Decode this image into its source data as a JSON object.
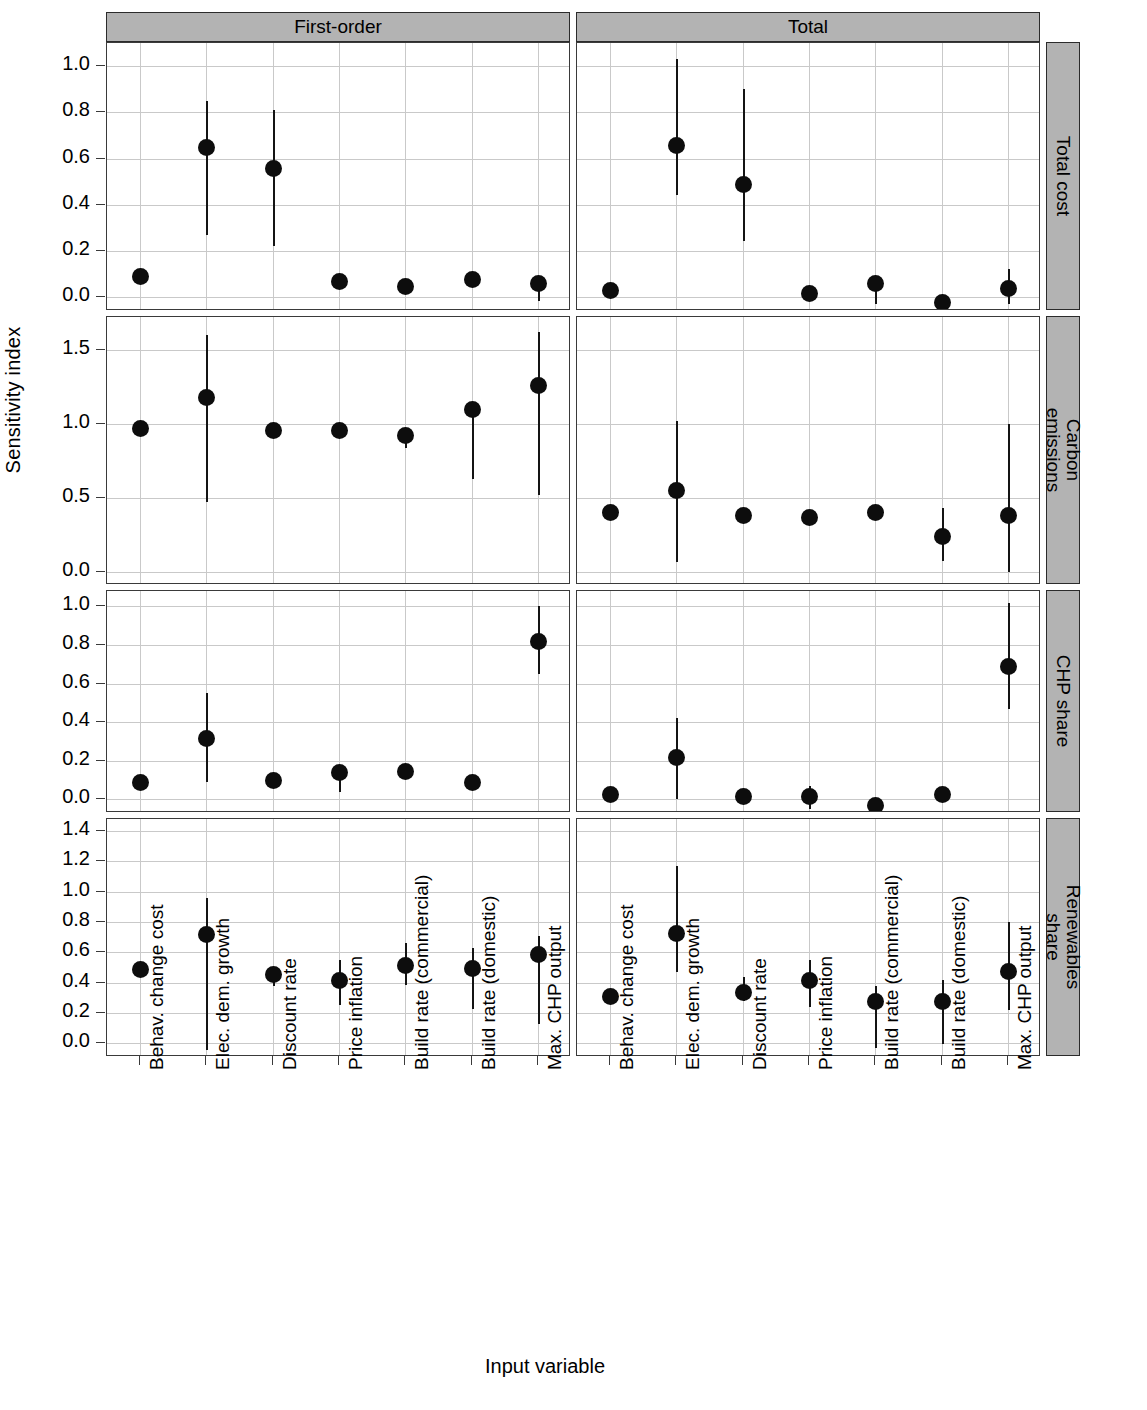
{
  "figure": {
    "y_axis_title": "Sensitivity index",
    "x_axis_title": "Input variable",
    "column_strips": [
      "First-order",
      "Total"
    ],
    "row_strips": [
      "Total cost",
      "Carbon\nemissions",
      "CHP share",
      "Renewables\nshare"
    ],
    "strip_fill": "#b3b3b3",
    "point_color": "#0d0d0d",
    "grid_color": "#c9c9c9"
  },
  "chart_data": {
    "type": "scatter",
    "title": "",
    "xlabel": "Input variable",
    "ylabel": "Sensitivity index",
    "grid": true,
    "legend": "none",
    "categories": [
      "Behav. change cost",
      "Elec. dem. growth",
      "Discount rate",
      "Price inflation",
      "Build rate (commercial)",
      "Build rate (domestic)",
      "Max. CHP output"
    ],
    "columns": [
      "First-order",
      "Total"
    ],
    "rows": [
      "Total cost",
      "Carbon emissions",
      "CHP share",
      "Renewables share"
    ],
    "panels": [
      {
        "row": "Total cost",
        "column": "First-order",
        "ylim": [
          -0.06,
          1.1
        ],
        "yticks": [
          0.0,
          0.2,
          0.4,
          0.6,
          0.8,
          1.0
        ],
        "yticklabels": [
          "0.0",
          "0.2",
          "0.4",
          "0.6",
          "0.8",
          "1.0"
        ],
        "values": [
          0.09,
          0.65,
          0.56,
          0.07,
          0.05,
          0.08,
          0.06
        ],
        "lower": [
          0.09,
          0.27,
          0.22,
          0.07,
          0.05,
          0.08,
          -0.02
        ],
        "upper": [
          0.09,
          0.85,
          0.81,
          0.07,
          0.05,
          0.08,
          0.06
        ]
      },
      {
        "row": "Total cost",
        "column": "Total",
        "ylim": [
          -0.06,
          1.1
        ],
        "yticks": [
          0.0,
          0.2,
          0.4,
          0.6,
          0.8,
          1.0
        ],
        "yticklabels": [
          "0.0",
          "0.2",
          "0.4",
          "0.6",
          "0.8",
          "1.0"
        ],
        "values": [
          0.03,
          0.66,
          0.49,
          0.02,
          0.06,
          -0.02,
          0.04
        ],
        "lower": [
          0.03,
          0.44,
          0.24,
          0.02,
          -0.03,
          -0.02,
          -0.03
        ],
        "upper": [
          0.03,
          1.03,
          0.9,
          0.02,
          0.09,
          -0.02,
          0.12
        ]
      },
      {
        "row": "Carbon emissions",
        "column": "First-order",
        "ylim": [
          -0.09,
          1.72
        ],
        "yticks": [
          0.0,
          0.5,
          1.0,
          1.5
        ],
        "yticklabels": [
          "0.0",
          "0.5",
          "1.0",
          "1.5"
        ],
        "values": [
          0.97,
          1.18,
          0.96,
          0.96,
          0.92,
          1.1,
          1.26
        ],
        "lower": [
          0.97,
          0.47,
          0.93,
          0.94,
          0.83,
          0.63,
          0.52
        ],
        "upper": [
          0.97,
          1.6,
          0.96,
          0.96,
          0.92,
          1.1,
          1.62
        ]
      },
      {
        "row": "Carbon emissions",
        "column": "Total",
        "ylim": [
          -0.09,
          1.72
        ],
        "yticks": [
          0.0,
          0.5,
          1.0,
          1.5
        ],
        "yticklabels": [
          "0.0",
          "0.5",
          "1.0",
          "1.5"
        ],
        "values": [
          0.4,
          0.55,
          0.38,
          0.37,
          0.4,
          0.24,
          0.38
        ],
        "lower": [
          0.4,
          0.07,
          0.38,
          0.37,
          0.38,
          0.07,
          0.0
        ],
        "upper": [
          0.4,
          1.02,
          0.38,
          0.37,
          0.45,
          0.43,
          1.0
        ]
      },
      {
        "row": "CHP share",
        "column": "First-order",
        "ylim": [
          -0.07,
          1.08
        ],
        "yticks": [
          0.0,
          0.2,
          0.4,
          0.6,
          0.8,
          1.0
        ],
        "yticklabels": [
          "0.0",
          "0.2",
          "0.4",
          "0.6",
          "0.8",
          "1.0"
        ],
        "values": [
          0.09,
          0.32,
          0.1,
          0.14,
          0.15,
          0.09,
          0.82
        ],
        "lower": [
          0.09,
          0.09,
          0.06,
          0.04,
          0.11,
          0.05,
          0.65
        ],
        "upper": [
          0.09,
          0.55,
          0.1,
          0.17,
          0.18,
          0.09,
          1.0
        ]
      },
      {
        "row": "CHP share",
        "column": "Total",
        "ylim": [
          -0.07,
          1.08
        ],
        "yticks": [
          0.0,
          0.2,
          0.4,
          0.6,
          0.8,
          1.0
        ],
        "yticklabels": [
          "0.0",
          "0.2",
          "0.4",
          "0.6",
          "0.8",
          "1.0"
        ],
        "values": [
          0.03,
          0.22,
          0.02,
          0.02,
          -0.03,
          0.03,
          0.69
        ],
        "lower": [
          0.03,
          0.0,
          0.02,
          -0.05,
          -0.03,
          0.03,
          0.47
        ],
        "upper": [
          0.03,
          0.42,
          0.02,
          0.07,
          -0.03,
          0.03,
          1.02
        ]
      },
      {
        "row": "Renewables share",
        "column": "First-order",
        "ylim": [
          -0.09,
          1.48
        ],
        "yticks": [
          0.0,
          0.2,
          0.4,
          0.6,
          0.8,
          1.0,
          1.2,
          1.4
        ],
        "yticklabels": [
          "0.0",
          "0.2",
          "0.4",
          "0.6",
          "0.8",
          "1.0",
          "1.2",
          "1.4"
        ],
        "values": [
          0.49,
          0.72,
          0.46,
          0.42,
          0.52,
          0.5,
          0.59
        ],
        "lower": [
          0.49,
          -0.04,
          0.38,
          0.25,
          0.38,
          0.23,
          0.13
        ],
        "upper": [
          0.49,
          0.96,
          0.46,
          0.55,
          0.66,
          0.63,
          0.71
        ]
      },
      {
        "row": "Renewables share",
        "column": "Total",
        "ylim": [
          -0.09,
          1.48
        ],
        "yticks": [
          0.0,
          0.2,
          0.4,
          0.6,
          0.8,
          1.0,
          1.2,
          1.4
        ],
        "yticklabels": [
          "0.0",
          "0.2",
          "0.4",
          "0.6",
          "0.8",
          "1.0",
          "1.2",
          "1.4"
        ],
        "values": [
          0.31,
          0.73,
          0.34,
          0.42,
          0.28,
          0.28,
          0.48
        ],
        "lower": [
          0.31,
          0.47,
          0.28,
          0.24,
          -0.03,
          0.0,
          0.22
        ],
        "upper": [
          0.31,
          1.17,
          0.44,
          0.55,
          0.38,
          0.42,
          0.8
        ]
      }
    ]
  }
}
